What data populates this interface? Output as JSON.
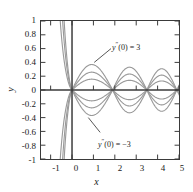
{
  "chart_data": {
    "type": "line",
    "title": "",
    "xlabel": "x",
    "ylabel": "y",
    "xlim": [
      -1.45,
      5.0
    ],
    "ylim": [
      -1,
      1
    ],
    "xticks": [
      -1,
      0,
      1,
      2,
      3,
      4,
      5
    ],
    "xticklabels": [
      "-1",
      "0",
      "1",
      "2",
      "3",
      "4",
      "5"
    ],
    "yticks": [
      -1,
      -0.8,
      -0.6,
      -0.4,
      -0.2,
      0,
      0.2,
      0.4,
      0.6,
      0.8,
      1
    ],
    "yticklabels": [
      "-1",
      "-0.8",
      "-0.6",
      "-0.4",
      "-0.2",
      "0",
      "0.2",
      "0.4",
      "0.6",
      "0.8",
      "1"
    ],
    "grid": false,
    "legend": "none",
    "line_color": "#9a9a9a",
    "axis_color": "#3a3a3a",
    "nodes_x": [
      0,
      1.9,
      3.5,
      4.9
    ],
    "series": [
      {
        "name": "y''(0) = 3",
        "amplitude": 0.4,
        "sign": 1
      },
      {
        "name": "y''(0) = 2",
        "amplitude": 0.28,
        "sign": 1
      },
      {
        "name": "y''(0) = 1",
        "amplitude": 0.17,
        "sign": 1
      },
      {
        "name": "y''(0) = -1",
        "amplitude": 0.17,
        "sign": -1
      },
      {
        "name": "y''(0) = -2",
        "amplitude": 0.28,
        "sign": -1
      },
      {
        "name": "y''(0) = -3",
        "amplitude": 0.4,
        "sign": -1
      }
    ],
    "annotations": [
      {
        "id": "upper",
        "text_prefix": "y",
        "text_prime": "″",
        "text_suffix": "(0) = 3",
        "x_text": 112,
        "y_text": 39
      },
      {
        "id": "lower",
        "text_prefix": "y",
        "text_prime": "″",
        "text_suffix": "(0) = −3",
        "x_text": 98,
        "y_text": 136
      }
    ]
  },
  "axis": {
    "x_title": "x",
    "y_title": "y"
  }
}
